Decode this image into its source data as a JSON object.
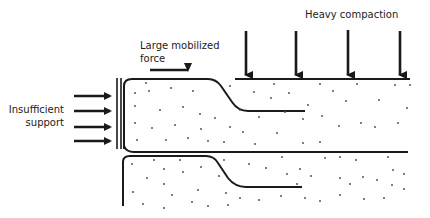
{
  "diagram": {
    "labels": {
      "heavy_compaction": "Heavy compaction",
      "mobilized_force_line1": "Large mobilized",
      "mobilized_force_line2": "force",
      "support_line1": "Insufficient",
      "support_line2": "support"
    },
    "compaction_arrows_x": [
      246,
      296,
      348,
      400
    ],
    "support_arrows_y": [
      96,
      111,
      127,
      141
    ],
    "colors": {
      "line": "#1a1a1a",
      "dots": "#555555",
      "background": "#ffffff"
    }
  }
}
